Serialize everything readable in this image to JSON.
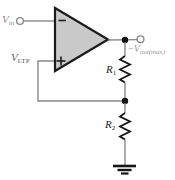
{
  "diagram": {
    "type": "circuit-schematic",
    "labels": {
      "vin": {
        "base": "V",
        "sub": "in"
      },
      "vltp": {
        "base": "V",
        "sub": "LTP"
      },
      "vout": {
        "sign": "−",
        "base": "V",
        "sub": "out(max)"
      },
      "r1": {
        "base": "R",
        "sub": "1"
      },
      "r2": {
        "base": "R",
        "sub": "2"
      }
    },
    "opamp": {
      "minus_symbol": "−",
      "plus_symbol": "+"
    },
    "components": [
      "op-amp",
      "resistor R1",
      "resistor R2",
      "ground",
      "input terminal",
      "output terminal"
    ],
    "colors": {
      "opamp_fill": "#c9c9c9",
      "opamp_outline": "#1b1b1b",
      "wire": "#8a8a8a",
      "component_stroke": "#141414",
      "label_gray": "#9a9a9a",
      "label_dark": "#222222",
      "background": "#ffffff"
    }
  }
}
